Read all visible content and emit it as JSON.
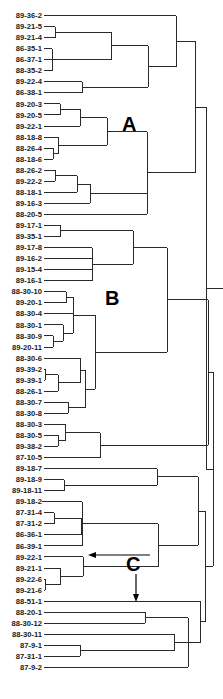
{
  "figure": {
    "type": "dendrogram",
    "orientation": "leaves-left, root-right",
    "leaves": [
      "89-36-2",
      "89-21-5",
      "89-21-4",
      "86-35-1",
      "86-37-1",
      "88-35-2",
      "89-22-4",
      "86-38-1",
      "89-20-3",
      "89-20-5",
      "89-22-1",
      "88-18-8",
      "88-26-4",
      "88-18-6",
      "88-26-2",
      "89-22-2",
      "88-18-1",
      "89-16-3",
      "88-20-5",
      "89-17-1",
      "89-35-1",
      "89-17-8",
      "89-16-2",
      "89-15-4",
      "89-16-1",
      "88-30-10",
      "89-20-1",
      "88-30-4",
      "88-30-1",
      "88-30-9",
      "89-20-11",
      "88-30-6",
      "89-39-2",
      "89-39-1",
      "88-26-1",
      "88-30-7",
      "88-30-8",
      "88-30-3",
      "88-30-5",
      "89-38-2",
      "87-10-5",
      "89-18-7",
      "89-18-9",
      "89-18-11",
      "89-18-2",
      "87-31-4",
      "87-31-2",
      "86-36-1",
      "86-39-1",
      "89-22-1",
      "89-21-1",
      "89-22-6",
      "89-21-6",
      "88-51-1",
      "88-20-1",
      "88-30-12",
      "88-30-11",
      "87-9-1",
      "87-31-1",
      "87-9-2"
    ],
    "clusters": [
      {
        "name": "cluster-a",
        "label": "A"
      },
      {
        "name": "cluster-b",
        "label": "B"
      },
      {
        "name": "cluster-c",
        "label": "C"
      }
    ]
  }
}
